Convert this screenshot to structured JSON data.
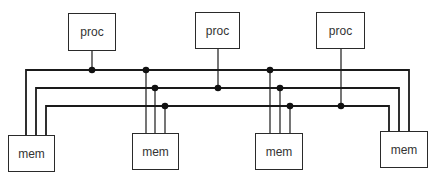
{
  "diagram": {
    "title": "",
    "colors": {
      "line": "#1a1a1a",
      "box_border": "#2a2a2a",
      "text": "#333333",
      "background": "#ffffff"
    },
    "processors": [
      {
        "id": "proc1",
        "label": "proc",
        "x": 68,
        "y": 13,
        "w": 48,
        "h": 38,
        "bus": 0,
        "tap_x": 92
      },
      {
        "id": "proc2",
        "label": "proc",
        "x": 195,
        "y": 12,
        "w": 45,
        "h": 37,
        "bus": 1,
        "tap_x": 218
      },
      {
        "id": "proc3",
        "label": "proc",
        "x": 316,
        "y": 12,
        "w": 49,
        "h": 37,
        "bus": 2,
        "tap_x": 341
      }
    ],
    "memories": [
      {
        "id": "mem1",
        "label": "mem",
        "x": 8,
        "y": 135,
        "w": 47,
        "h": 37
      },
      {
        "id": "mem2",
        "label": "mem",
        "x": 132,
        "y": 133,
        "w": 47,
        "h": 37
      },
      {
        "id": "mem3",
        "label": "mem",
        "x": 255,
        "y": 133,
        "w": 48,
        "h": 37
      },
      {
        "id": "mem4",
        "label": "mem",
        "x": 380,
        "y": 131,
        "w": 48,
        "h": 37
      }
    ],
    "buses": [
      {
        "id": "bus1",
        "y": 70,
        "x_left": 26,
        "x_right": 409
      },
      {
        "id": "bus2",
        "y": 88,
        "x_left": 36,
        "x_right": 399
      },
      {
        "id": "bus3",
        "y": 106,
        "x_left": 46,
        "x_right": 389
      }
    ],
    "memory_taps": [
      {
        "mem": "mem2",
        "xs": [
          146,
          155,
          165
        ]
      },
      {
        "mem": "mem3",
        "xs": [
          270,
          280,
          290
        ]
      }
    ],
    "labels": {
      "proc1": "proc",
      "proc2": "proc",
      "proc3": "proc",
      "mem1": "mem",
      "mem2": "mem",
      "mem3": "mem",
      "mem4": "mem"
    }
  }
}
